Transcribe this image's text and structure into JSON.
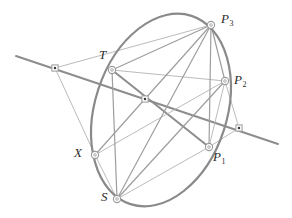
{
  "figure": {
    "width": 292,
    "height": 218,
    "background": "#ffffff"
  },
  "style": {
    "conic_color": "#8a8a8a",
    "thick_line_color": "#8d8d8d",
    "thin_line_color": "#b3b3b3",
    "medium_line_color": "#9e9e9e",
    "node_stroke": "#9a9a9a",
    "node_fill": "#ffffff",
    "dot_fill": "#3a3a3a",
    "label_color": "#2b2b2b",
    "conic_width": 2.2,
    "thick_width": 2.0,
    "thin_width": 0.9,
    "medium_width": 1.2
  },
  "conic": {
    "name": "ellipse",
    "cx": 161,
    "cy": 110,
    "rx": 66,
    "ry": 99,
    "rotation_deg": 18
  },
  "points": [
    {
      "id": "P3",
      "label": "P",
      "sub": "3",
      "x": 211,
      "y": 25,
      "marker": "circle",
      "label_x": 221,
      "label_y": 12
    },
    {
      "id": "P2",
      "label": "P",
      "sub": "2",
      "x": 225,
      "y": 81,
      "marker": "circle",
      "label_x": 234,
      "label_y": 73
    },
    {
      "id": "P1",
      "label": "P",
      "sub": "1",
      "x": 209,
      "y": 147,
      "marker": "circle",
      "label_x": 213,
      "label_y": 150
    },
    {
      "id": "T",
      "label": "T",
      "sub": "",
      "x": 112,
      "y": 70,
      "marker": "circle",
      "label_x": 99,
      "label_y": 48
    },
    {
      "id": "X",
      "label": "X",
      "sub": "",
      "x": 95,
      "y": 155,
      "marker": "circle",
      "label_x": 74,
      "label_y": 146
    },
    {
      "id": "S",
      "label": "S",
      "sub": "",
      "x": 117,
      "y": 199,
      "marker": "circle",
      "label_x": 101,
      "label_y": 190
    },
    {
      "id": "L",
      "label": "",
      "sub": "",
      "x": 55,
      "y": 68,
      "marker": "dot",
      "label_x": 0,
      "label_y": 0
    },
    {
      "id": "C",
      "label": "",
      "sub": "",
      "x": 145,
      "y": 99,
      "marker": "dot",
      "label_x": 0,
      "label_y": 0
    },
    {
      "id": "R",
      "label": "",
      "sub": "",
      "x": 239,
      "y": 128,
      "marker": "dot",
      "label_x": 0,
      "label_y": 0
    }
  ],
  "segments": [
    {
      "name": "transversal-line",
      "x1": 16,
      "y1": 56,
      "x2": 278,
      "y2": 144,
      "weight": "thick"
    },
    {
      "name": "T-to-P1",
      "x1": 112,
      "y1": 70,
      "x2": 209,
      "y2": 147,
      "weight": "thick"
    },
    {
      "name": "X-to-P2",
      "x1": 95,
      "y1": 155,
      "x2": 225,
      "y2": 81,
      "weight": "thin"
    },
    {
      "name": "L-to-X",
      "x1": 55,
      "y1": 68,
      "x2": 95,
      "y2": 155,
      "weight": "thin"
    },
    {
      "name": "L-to-P3",
      "x1": 55,
      "y1": 68,
      "x2": 211,
      "y2": 25,
      "weight": "thin"
    },
    {
      "name": "T-to-P3",
      "x1": 112,
      "y1": 70,
      "x2": 211,
      "y2": 25,
      "weight": "medium"
    },
    {
      "name": "T-to-P2",
      "x1": 112,
      "y1": 70,
      "x2": 225,
      "y2": 81,
      "weight": "thin"
    },
    {
      "name": "T-to-S",
      "x1": 112,
      "y1": 70,
      "x2": 117,
      "y2": 199,
      "weight": "medium"
    },
    {
      "name": "X-to-P3",
      "x1": 95,
      "y1": 155,
      "x2": 211,
      "y2": 25,
      "weight": "medium"
    },
    {
      "name": "X-to-S",
      "x1": 95,
      "y1": 155,
      "x2": 117,
      "y2": 199,
      "weight": "thin"
    },
    {
      "name": "S-to-P3",
      "x1": 117,
      "y1": 199,
      "x2": 211,
      "y2": 25,
      "weight": "medium"
    },
    {
      "name": "S-to-P2",
      "x1": 117,
      "y1": 199,
      "x2": 225,
      "y2": 81,
      "weight": "medium"
    },
    {
      "name": "S-to-P1",
      "x1": 117,
      "y1": 199,
      "x2": 209,
      "y2": 147,
      "weight": "thin"
    },
    {
      "name": "P3-to-P2",
      "x1": 211,
      "y1": 25,
      "x2": 225,
      "y2": 81,
      "weight": "medium"
    },
    {
      "name": "P3-to-P1",
      "x1": 211,
      "y1": 25,
      "x2": 209,
      "y2": 147,
      "weight": "medium"
    },
    {
      "name": "P2-to-P1",
      "x1": 225,
      "y1": 81,
      "x2": 209,
      "y2": 147,
      "weight": "thin"
    },
    {
      "name": "P2-to-R",
      "x1": 225,
      "y1": 81,
      "x2": 239,
      "y2": 128,
      "weight": "thin"
    },
    {
      "name": "P1-to-R",
      "x1": 209,
      "y1": 147,
      "x2": 239,
      "y2": 128,
      "weight": "thin"
    }
  ]
}
